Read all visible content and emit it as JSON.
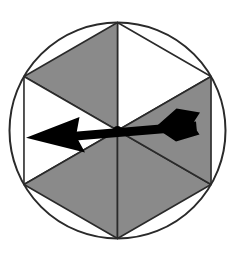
{
  "figure": {
    "name": "spinner-wheel",
    "type": "probability-spinner",
    "background_color": "#ffffff",
    "width": 239,
    "height": 256
  },
  "wheel": {
    "center_x": 117.5,
    "center_y": 130.5,
    "radius": 108,
    "outline_color": "#2a2a2a",
    "outline_width": 2,
    "sector_count": 6,
    "sector_angle_degrees": 60,
    "colors": {
      "gray": "#8a8a8a",
      "white": "#ffffff",
      "divider": "#2a2a2a",
      "arrow": "#000000"
    },
    "sectors": [
      {
        "id": "sector-1",
        "label": "upper-right",
        "fill": "white",
        "start_deg": 30,
        "end_deg": 90
      },
      {
        "id": "sector-2",
        "label": "upper-left",
        "fill": "gray",
        "start_deg": 90,
        "end_deg": 150
      },
      {
        "id": "sector-3",
        "label": "left",
        "fill": "white",
        "start_deg": 150,
        "end_deg": 210
      },
      {
        "id": "sector-4",
        "label": "lower-left",
        "fill": "gray",
        "start_deg": 210,
        "end_deg": 270
      },
      {
        "id": "sector-5",
        "label": "lower-right",
        "fill": "gray",
        "start_deg": 270,
        "end_deg": 330
      },
      {
        "id": "sector-6",
        "label": "right",
        "fill": "gray",
        "start_deg": 330,
        "end_deg": 30
      }
    ],
    "counts": {
      "gray_sectors": 4,
      "white_sectors": 2
    }
  },
  "pointer": {
    "name": "spinner-arrow",
    "direction_degrees": 180,
    "direction_label": "left",
    "pointing_at_sector": "sector-3",
    "fill": "#000000",
    "tip_x": 26,
    "tip_y": 137,
    "tail_x": 198,
    "tail_y": 125
  },
  "chart_data": {
    "type": "pie",
    "title": "",
    "categories": [
      "upper-right",
      "upper-left",
      "left",
      "lower-left",
      "lower-right",
      "right"
    ],
    "values": [
      60,
      60,
      60,
      60,
      60,
      60
    ],
    "value_unit": "degrees",
    "slice_colors": [
      "#ffffff",
      "#8a8a8a",
      "#ffffff",
      "#8a8a8a",
      "#8a8a8a",
      "#8a8a8a"
    ],
    "legend": [],
    "xlabel": "",
    "ylabel": "",
    "grid": false
  }
}
